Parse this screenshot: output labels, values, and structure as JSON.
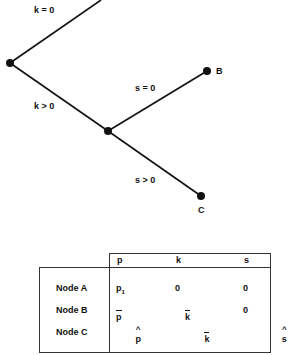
{
  "diagram": {
    "edges": [
      {
        "from": "A",
        "to": "top",
        "label": "k = 0"
      },
      {
        "from": "A",
        "to": "mid",
        "label": "k > 0"
      },
      {
        "from": "mid",
        "to": "B",
        "label": "s = 0"
      },
      {
        "from": "mid",
        "to": "C",
        "label": "s > 0"
      }
    ],
    "labels": {
      "k_zero": "k = 0",
      "k_pos": "k > 0",
      "s_zero": "s = 0",
      "s_pos": "s > 0",
      "node_b": "B",
      "node_c": "C"
    }
  },
  "table": {
    "columns": [
      "p",
      "k",
      "s"
    ],
    "rows": [
      {
        "node": "Node A",
        "p": "p",
        "p_sub": "1",
        "p_mark": "",
        "k": "0",
        "k_mark": "",
        "s": "0",
        "s_mark": ""
      },
      {
        "node": "Node B",
        "p": "p",
        "p_mark": "bar",
        "k": "k",
        "k_mark": "bar",
        "s": "0",
        "s_mark": ""
      },
      {
        "node": "Node C",
        "p": "p",
        "p_mark": "hat",
        "k": "k",
        "k_mark": "bar",
        "s": "s",
        "s_mark": "hat"
      }
    ]
  }
}
